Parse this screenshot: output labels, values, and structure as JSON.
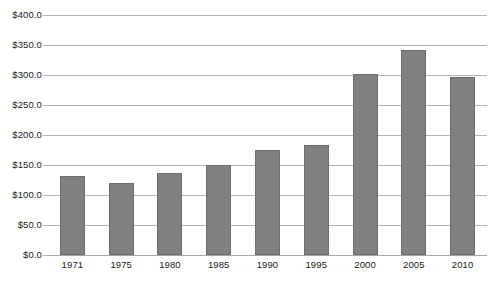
{
  "chart_data": {
    "type": "bar",
    "title": "",
    "subtitle": "",
    "xlabel": "",
    "ylabel": "",
    "categories": [
      "1971",
      "1975",
      "1980",
      "1985",
      "1990",
      "1995",
      "2000",
      "2005",
      "2010"
    ],
    "values": [
      131,
      120,
      137,
      150,
      175,
      183,
      302,
      341,
      296
    ],
    "ylim": [
      0,
      400
    ],
    "ytick_values": [
      0,
      50,
      100,
      150,
      200,
      250,
      300,
      350,
      400
    ],
    "ytick_labels": [
      "$0.0",
      "$50.0",
      "$100.0",
      "$150.0",
      "$200.0",
      "$250.0",
      "$300.0",
      "$350.0",
      "$400.0"
    ],
    "grid": true,
    "grid_axis": "y",
    "legend": false,
    "legend_position": "none",
    "series": [
      {
        "name": "",
        "values": [
          131,
          120,
          137,
          150,
          175,
          183,
          302,
          341,
          296
        ]
      }
    ],
    "colors": {
      "bar_fill": "#808080",
      "bar_border": "#6e6e6e",
      "gridline": "#b4b4b4",
      "axis_text": "#1a1a1a",
      "background": "#ffffff"
    }
  }
}
